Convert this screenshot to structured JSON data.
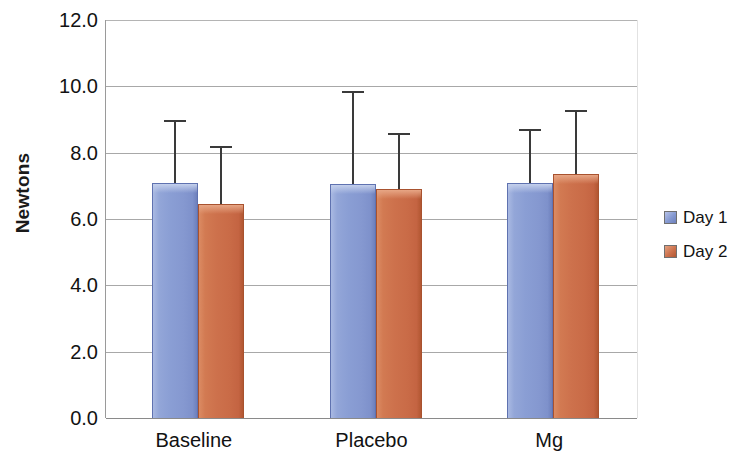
{
  "chart_data": {
    "type": "bar",
    "title": "",
    "subtitle": "",
    "xlabel": "",
    "ylabel": "Newtons",
    "categories": [
      "Baseline",
      "Placebo",
      "Mg"
    ],
    "series": [
      {
        "name": "Day 1",
        "color": "#8a9ed4",
        "values": [
          7.1,
          7.05,
          7.1
        ],
        "error_upper": [
          9.0,
          9.85,
          8.7
        ]
      },
      {
        "name": "Day 2",
        "color": "#cd714c",
        "values": [
          6.45,
          6.9,
          7.35
        ],
        "error_upper": [
          8.2,
          8.6,
          9.3
        ]
      }
    ],
    "ylim": [
      0.0,
      12.0
    ],
    "ytick_step": 2.0,
    "ytick_labels": [
      "12.0",
      "10.0",
      "8.0",
      "6.0",
      "4.0",
      "2.0",
      "0.0"
    ],
    "ytick_values": [
      12.0,
      10.0,
      8.0,
      6.0,
      4.0,
      2.0,
      0.0
    ],
    "grid": "horizontal",
    "legend_position": "right",
    "error_bars": "upper-only"
  },
  "legend": {
    "entries": [
      {
        "label": "Day 1",
        "swatch": "day1-swatch"
      },
      {
        "label": "Day 2",
        "swatch": "day2-swatch"
      }
    ]
  }
}
